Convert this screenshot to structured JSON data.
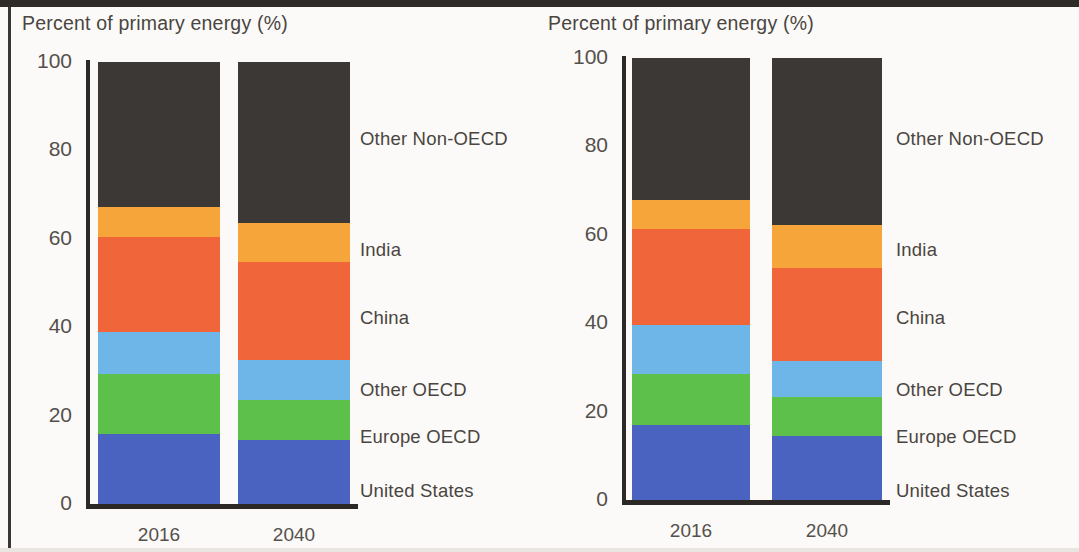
{
  "page": {
    "background_color": "#fbfaf8",
    "frame_color": "#2e2b28"
  },
  "charts": [
    {
      "id": "left",
      "title": "Percent of primary energy (%)",
      "ytick_labels": [
        "100",
        "80",
        "60",
        "40",
        "20",
        "0"
      ],
      "xtick_labels": [
        "2016",
        "2040"
      ],
      "legend": [
        "Other Non-OECD",
        "India",
        "China",
        "Other OECD",
        "Europe OECD",
        "United States"
      ]
    },
    {
      "id": "right",
      "title": "Percent of primary energy (%)",
      "ytick_labels": [
        "100",
        "80",
        "60",
        "40",
        "20",
        "0"
      ],
      "xtick_labels": [
        "2016",
        "2040"
      ],
      "legend": [
        "Other Non-OECD",
        "India",
        "China",
        "Other OECD",
        "Europe OECD",
        "United States"
      ]
    }
  ],
  "chart_data": [
    {
      "type": "bar",
      "subtype": "stacked-vertical-100",
      "panel": "left",
      "title": "Percent of primary energy (%)",
      "xlabel": "",
      "ylabel": "Percent of primary energy (%)",
      "categories": [
        "2016",
        "2040"
      ],
      "ylim": [
        0,
        100
      ],
      "yticks": [
        0,
        20,
        40,
        60,
        80,
        100
      ],
      "grid": false,
      "legend_position": "right",
      "series": [
        {
          "name": "United States",
          "color": "#4a62c0",
          "values": [
            15.8,
            14.5
          ]
        },
        {
          "name": "Europe OECD",
          "color": "#5cc04a",
          "values": [
            13.6,
            9.1
          ]
        },
        {
          "name": "Other OECD",
          "color": "#6fb6e8",
          "values": [
            9.6,
            9.0
          ]
        },
        {
          "name": "China",
          "color": "#f0663a",
          "values": [
            21.5,
            22.2
          ]
        },
        {
          "name": "India",
          "color": "#f5a53a",
          "values": [
            6.7,
            8.7
          ]
        },
        {
          "name": "Other Non-OECD",
          "color": "#3c3836",
          "values": [
            32.8,
            36.5
          ]
        }
      ]
    },
    {
      "type": "bar",
      "subtype": "stacked-vertical-100",
      "panel": "right",
      "title": "Percent of primary energy (%)",
      "xlabel": "",
      "ylabel": "Percent of primary energy (%)",
      "categories": [
        "2016",
        "2040"
      ],
      "ylim": [
        0,
        100
      ],
      "yticks": [
        0,
        20,
        40,
        60,
        80,
        100
      ],
      "grid": false,
      "legend_position": "right",
      "series": [
        {
          "name": "United States",
          "color": "#4a62c0",
          "values": [
            17.0,
            14.4
          ]
        },
        {
          "name": "Europe OECD",
          "color": "#5cc04a",
          "values": [
            11.5,
            8.9
          ]
        },
        {
          "name": "Other OECD",
          "color": "#6fb6e8",
          "values": [
            11.0,
            8.2
          ]
        },
        {
          "name": "China",
          "color": "#f0663a",
          "values": [
            21.7,
            21.0
          ]
        },
        {
          "name": "India",
          "color": "#f5a53a",
          "values": [
            6.6,
            9.8
          ]
        },
        {
          "name": "Other Non-OECD",
          "color": "#3c3836",
          "values": [
            32.2,
            37.7
          ]
        }
      ]
    }
  ],
  "geometry": {
    "panels": [
      {
        "left": 0,
        "title_x": 22,
        "title_y": 12,
        "axis_x": 86,
        "plot_top": 62,
        "plot_bottom": 504,
        "tick_right": 72,
        "bars": [
          {
            "x": 98,
            "w": 122
          },
          {
            "x": 238,
            "w": 112
          }
        ],
        "legend_x": 360
      },
      {
        "left": 532,
        "title_x": 16,
        "title_y": 12,
        "axis_x": 90,
        "plot_top": 58,
        "plot_bottom": 500,
        "tick_right": 76,
        "bars": [
          {
            "x": 100,
            "w": 118
          },
          {
            "x": 240,
            "w": 110
          }
        ],
        "legend_x": 364
      }
    ],
    "legend_y": [
      128,
      239,
      307,
      379,
      426,
      480
    ]
  }
}
